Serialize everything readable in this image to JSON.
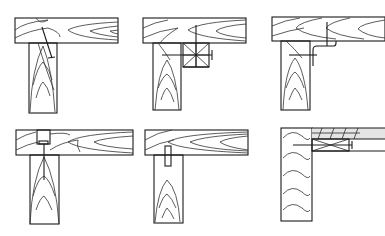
{
  "diagram": {
    "type": "technical-illustration",
    "layout": {
      "rows": 2,
      "cols": 3
    },
    "background": "#ffffff",
    "line_color": "#1a1a1a",
    "panels": [
      {
        "id": "p1",
        "position": "top-left",
        "fastener": "diagonal screw through beam into post"
      },
      {
        "id": "p2",
        "position": "top-middle",
        "fastener": "corner block with crossed bolts"
      },
      {
        "id": "p3",
        "position": "top-right",
        "fastener": "angled metal bracket with screws"
      },
      {
        "id": "p4",
        "position": "bottom-left",
        "fastener": "recessed screw from top of beam into post"
      },
      {
        "id": "p5",
        "position": "bottom-middle",
        "fastener": "dowel / tenon into beam"
      },
      {
        "id": "p6",
        "position": "bottom-right",
        "fastener": "side-mounted board with cross block and bolt"
      }
    ]
  }
}
